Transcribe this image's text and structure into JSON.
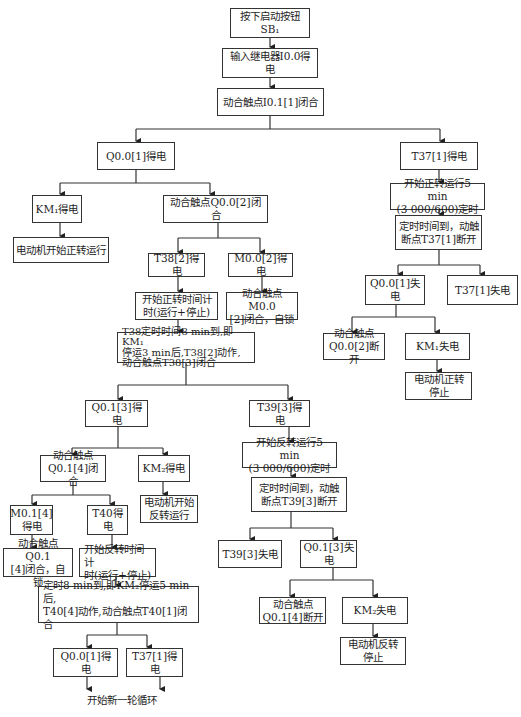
{
  "nodes": {
    "n1": "按下启动按钮SB₁",
    "n2": "输入继电器I0.0得电",
    "n3": "动合触点I0.1[1]闭合",
    "n4": "Q0.0[1]得电",
    "n5": "T37[1]得电",
    "n6": "KM₁得电",
    "n7": "动合触点Q0.0[2]闭合",
    "n8": "电动机开始正转运行",
    "n9": "T38[2]得电",
    "n10": "M0.0[2]得电",
    "n11": "开始正转时间计\n时(运行+停止)",
    "n12": "动合触点M0.0\n[2]闭合，自锁",
    "n13": "T38定时时间8 min到,即KM₁\n停运3 min后,T38[2]动作,\n动合触点T38[3]闭合",
    "n14": "开始正转运行5 min\n(3 000/600)定时",
    "n15": "定时时间到，动触\n断点T37[1]断开",
    "n16": "Q0.0[1]失电",
    "n17": "T37[1]失电",
    "n18": "动合触点\nQ0.0[2]断开",
    "n19": "KM₁失电",
    "n20": "电动机正转\n停止",
    "n21": "Q0.1[3]得电",
    "n22": "T39[3]得电",
    "n23": "动合触点\nQ0.1[4]闭合",
    "n24": "KM₂得电",
    "n25": "电动机开始\n反转运行",
    "n26": "开始反转运行5 min\n(3 000/600)定时",
    "n27": "定时时间到，动触\n断点T39[3]断开",
    "n28": "M0.1[4]\n得电",
    "n29": "T40得电",
    "n30": "动合触点Q0.1\n[4]闭合，自锁",
    "n31": "开始反转时间计\n时(运行+停止)",
    "n32": "T39[3]失电",
    "n33": "Q0.1[3]失电",
    "n34": "定时8 min到,即KM₂停运5 min后,\nT40[4]动作,动合触点T40[1]闭合",
    "n35": "动合触点\nQ0.1[4]断开",
    "n36": "KM₂失电",
    "n37": "电动机反转\n停止",
    "n38": "Q0.0[1]得电",
    "n39": "T37[1]得电"
  },
  "end_label": "开始新一轮循环"
}
